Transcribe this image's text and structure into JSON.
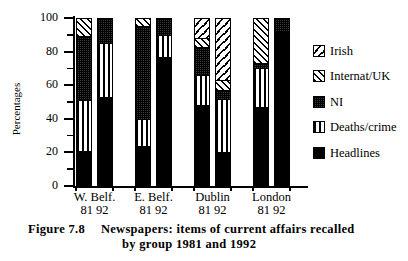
{
  "figure": {
    "number_label": "Figure 7.8",
    "caption_line1": "Newspapers:  items  of  current  affairs  recalled",
    "caption_line2": "by group 1981 and 1992"
  },
  "axes": {
    "ylabel": "Percentages",
    "ytick_labels": [
      "0",
      "20",
      "40",
      "60",
      "80",
      "100"
    ],
    "ytick_values": [
      0,
      20,
      40,
      60,
      80,
      100
    ],
    "yminor_values": [
      10,
      30,
      50,
      70,
      90
    ],
    "ylim": [
      0,
      100
    ],
    "group_labels": [
      "W. Belf.",
      "E. Belf.",
      "Dublin",
      "London"
    ],
    "group_years": [
      "81 92",
      "81 92",
      "81 92",
      "81 92"
    ]
  },
  "legend": {
    "position": "right",
    "entries": [
      {
        "label": "Irish",
        "pattern": "irish",
        "swatch": "sparse-backslash-hatch"
      },
      {
        "label": "Internat/UK",
        "pattern": "internat",
        "swatch": "diagonal-hatch"
      },
      {
        "label": "NI",
        "pattern": "ni",
        "swatch": "dark-checker"
      },
      {
        "label": "Deaths/crime",
        "pattern": "deaths",
        "swatch": "vertical-stripes"
      },
      {
        "label": "Headlines",
        "pattern": "headlines",
        "swatch": "solid-black"
      }
    ]
  },
  "chart_data": {
    "type": "bar",
    "subtype": "stacked-vertical-100-percent",
    "xlabel": "",
    "ylabel": "Percentages",
    "ylim": [
      0,
      100
    ],
    "grid": false,
    "legend_position": "right",
    "categories": [
      "W. Belf. 81",
      "W. Belf. 92",
      "E. Belf. 81",
      "E. Belf. 92",
      "Dublin 81",
      "Dublin 92",
      "London 81",
      "London 92"
    ],
    "groups": [
      "W. Belf.",
      "E. Belf.",
      "Dublin",
      "London"
    ],
    "years": [
      "81",
      "92"
    ],
    "stack_order_bottom_to_top": [
      "Headlines",
      "Deaths/crime",
      "NI",
      "Internat/UK",
      "Irish"
    ],
    "series": [
      {
        "name": "Headlines",
        "pattern": "headlines",
        "values": [
          21,
          53,
          24,
          77,
          48,
          20,
          47,
          92
        ]
      },
      {
        "name": "Deaths/crime",
        "pattern": "deaths",
        "values": [
          30,
          32,
          16,
          13,
          18,
          32,
          23,
          0
        ]
      },
      {
        "name": "NI",
        "pattern": "ni",
        "values": [
          38,
          15,
          55,
          10,
          17,
          5,
          3,
          8
        ]
      },
      {
        "name": "Internat/UK",
        "pattern": "internat",
        "values": [
          11,
          0,
          5,
          0,
          5,
          6,
          27,
          0
        ]
      },
      {
        "name": "Irish",
        "pattern": "irish",
        "values": [
          0,
          0,
          0,
          0,
          12,
          37,
          0,
          0
        ]
      }
    ],
    "bars": [
      {
        "label": "W. Belf. 81",
        "group": "W. Belf.",
        "year": "81",
        "segments": [
          {
            "name": "Headlines",
            "value": 21,
            "cum_top": 21
          },
          {
            "name": "Deaths/crime",
            "value": 30,
            "cum_top": 51
          },
          {
            "name": "NI",
            "value": 38,
            "cum_top": 89
          },
          {
            "name": "Internat/UK",
            "value": 11,
            "cum_top": 100
          },
          {
            "name": "Irish",
            "value": 0,
            "cum_top": 100
          }
        ]
      },
      {
        "label": "W. Belf. 92",
        "group": "W. Belf.",
        "year": "92",
        "segments": [
          {
            "name": "Headlines",
            "value": 53,
            "cum_top": 53
          },
          {
            "name": "Deaths/crime",
            "value": 32,
            "cum_top": 85
          },
          {
            "name": "NI",
            "value": 15,
            "cum_top": 100
          },
          {
            "name": "Internat/UK",
            "value": 0,
            "cum_top": 100
          },
          {
            "name": "Irish",
            "value": 0,
            "cum_top": 100
          }
        ]
      },
      {
        "label": "E. Belf. 81",
        "group": "E. Belf.",
        "year": "81",
        "segments": [
          {
            "name": "Headlines",
            "value": 24,
            "cum_top": 24
          },
          {
            "name": "Deaths/crime",
            "value": 16,
            "cum_top": 40
          },
          {
            "name": "NI",
            "value": 55,
            "cum_top": 95
          },
          {
            "name": "Internat/UK",
            "value": 5,
            "cum_top": 100
          },
          {
            "name": "Irish",
            "value": 0,
            "cum_top": 100
          }
        ]
      },
      {
        "label": "E. Belf. 92",
        "group": "E. Belf.",
        "year": "92",
        "segments": [
          {
            "name": "Headlines",
            "value": 77,
            "cum_top": 77
          },
          {
            "name": "Deaths/crime",
            "value": 13,
            "cum_top": 90
          },
          {
            "name": "NI",
            "value": 10,
            "cum_top": 100
          },
          {
            "name": "Internat/UK",
            "value": 0,
            "cum_top": 100
          },
          {
            "name": "Irish",
            "value": 0,
            "cum_top": 100
          }
        ]
      },
      {
        "label": "Dublin 81",
        "group": "Dublin",
        "year": "81",
        "segments": [
          {
            "name": "Headlines",
            "value": 48,
            "cum_top": 48
          },
          {
            "name": "Deaths/crime",
            "value": 18,
            "cum_top": 66
          },
          {
            "name": "NI",
            "value": 17,
            "cum_top": 83
          },
          {
            "name": "Internat/UK",
            "value": 5,
            "cum_top": 88
          },
          {
            "name": "Irish",
            "value": 12,
            "cum_top": 100
          }
        ]
      },
      {
        "label": "Dublin 92",
        "group": "Dublin",
        "year": "92",
        "segments": [
          {
            "name": "Headlines",
            "value": 20,
            "cum_top": 20
          },
          {
            "name": "Deaths/crime",
            "value": 32,
            "cum_top": 52
          },
          {
            "name": "NI",
            "value": 5,
            "cum_top": 57
          },
          {
            "name": "Internat/UK",
            "value": 6,
            "cum_top": 63
          },
          {
            "name": "Irish",
            "value": 37,
            "cum_top": 100
          }
        ]
      },
      {
        "label": "London 81",
        "group": "London",
        "year": "81",
        "segments": [
          {
            "name": "Headlines",
            "value": 47,
            "cum_top": 47
          },
          {
            "name": "Deaths/crime",
            "value": 23,
            "cum_top": 70
          },
          {
            "name": "NI",
            "value": 3,
            "cum_top": 73
          },
          {
            "name": "Internat/UK",
            "value": 27,
            "cum_top": 100
          },
          {
            "name": "Irish",
            "value": 0,
            "cum_top": 100
          }
        ]
      },
      {
        "label": "London 92",
        "group": "London",
        "year": "92",
        "segments": [
          {
            "name": "Headlines",
            "value": 92,
            "cum_top": 92
          },
          {
            "name": "Deaths/crime",
            "value": 0,
            "cum_top": 92
          },
          {
            "name": "NI",
            "value": 8,
            "cum_top": 100
          },
          {
            "name": "Internat/UK",
            "value": 0,
            "cum_top": 100
          },
          {
            "name": "Irish",
            "value": 0,
            "cum_top": 100
          }
        ]
      }
    ]
  }
}
